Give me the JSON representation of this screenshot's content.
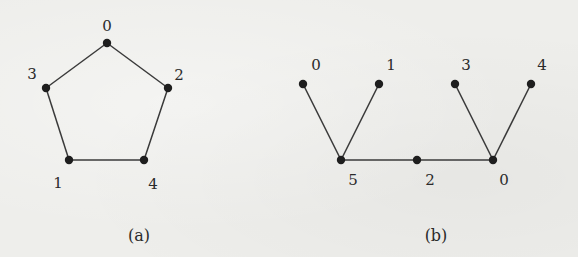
{
  "figure_a": {
    "caption": "(a)",
    "caption_pos": [
      139,
      235
    ],
    "nodes": [
      {
        "label": "0",
        "x": 107,
        "y": 43,
        "lx": 107,
        "ly": 26
      },
      {
        "label": "3",
        "x": 46,
        "y": 88,
        "lx": 32,
        "ly": 74
      },
      {
        "label": "2",
        "x": 168,
        "y": 88,
        "lx": 179,
        "ly": 75
      },
      {
        "label": "1",
        "x": 69,
        "y": 160,
        "lx": 58,
        "ly": 183
      },
      {
        "label": "4",
        "x": 144,
        "y": 160,
        "lx": 153,
        "ly": 184
      }
    ],
    "edges": [
      [
        0,
        1
      ],
      [
        0,
        2
      ],
      [
        1,
        3
      ],
      [
        3,
        4
      ],
      [
        4,
        2
      ]
    ]
  },
  "figure_b": {
    "caption": "(b)",
    "caption_pos": [
      436,
      235
    ],
    "nodes": [
      {
        "label": "0",
        "x": 303,
        "y": 84,
        "lx": 316,
        "ly": 65
      },
      {
        "label": "1",
        "x": 379,
        "y": 84,
        "lx": 391,
        "ly": 65
      },
      {
        "label": "3",
        "x": 455,
        "y": 84,
        "lx": 466,
        "ly": 65
      },
      {
        "label": "4",
        "x": 531,
        "y": 84,
        "lx": 542,
        "ly": 65
      },
      {
        "label": "5",
        "x": 341,
        "y": 160,
        "lx": 353,
        "ly": 180
      },
      {
        "label": "2",
        "x": 417,
        "y": 160,
        "lx": 430,
        "ly": 180
      },
      {
        "label": "0",
        "x": 493,
        "y": 160,
        "lx": 504,
        "ly": 180
      }
    ],
    "edges": [
      [
        0,
        4
      ],
      [
        1,
        4
      ],
      [
        4,
        5
      ],
      [
        5,
        6
      ],
      [
        2,
        6
      ],
      [
        3,
        6
      ]
    ]
  }
}
